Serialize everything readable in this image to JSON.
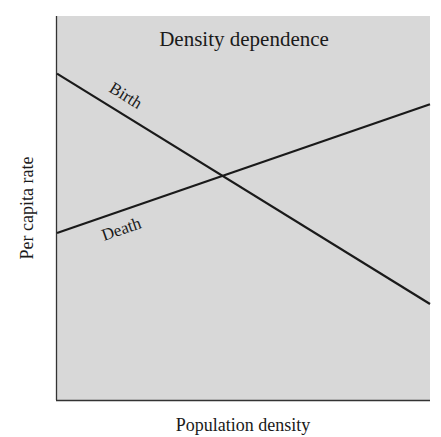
{
  "chart_data": {
    "type": "line",
    "title": "Density dependence",
    "xlabel": "Population density",
    "ylabel": "Per capita rate",
    "xlim": [
      0,
      10
    ],
    "ylim": [
      0,
      10
    ],
    "grid": false,
    "ticks": false,
    "legend": "inline labels on lines",
    "series": [
      {
        "name": "Birth",
        "x": [
          0,
          10
        ],
        "y": [
          8.5,
          2.5
        ],
        "trend": "decreasing"
      },
      {
        "name": "Death",
        "x": [
          0,
          10
        ],
        "y": [
          4.35,
          7.7
        ],
        "trend": "increasing"
      }
    ],
    "annotations": [
      {
        "text": "Birth",
        "attached_to": "Birth",
        "position": "above line near left"
      },
      {
        "text": "Death",
        "attached_to": "Death",
        "position": "below line near left"
      }
    ],
    "intersection": {
      "x": 4.5,
      "y": 5.8
    }
  },
  "colors": {
    "plot_background": "#d8d8d8",
    "line": "#1a1a1a",
    "axis": "#333333"
  },
  "plot": {
    "x0": 56,
    "y0": 16,
    "x1": 430,
    "y1": 400
  }
}
